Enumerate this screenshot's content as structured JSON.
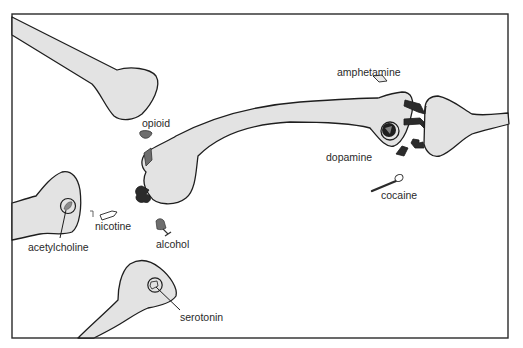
{
  "figure": {
    "type": "neuron-synapse-diagram",
    "frame_color": "#2a2a2a",
    "cell_fill": "#e3e3e3",
    "dark_fill": "#2b2b2b",
    "mid_fill": "#6e6e6e"
  },
  "labels": {
    "opioid": "opioid",
    "amphetamine": "amphetamine",
    "dopamine": "dopamine",
    "cocaine": "cocaine",
    "nicotine": "nicotine",
    "acetylcholine": "acetylcholine",
    "alcohol": "alcohol",
    "serotonin": "serotonin"
  },
  "elements": [
    {
      "id": "top-left-neuron",
      "description": "neuron terminal entering from top-left"
    },
    {
      "id": "central-neuron",
      "description": "long neuron from cell body (center-left) to axon terminal (right)"
    },
    {
      "id": "right-postsynaptic-neuron",
      "description": "postsynaptic dendrite with dopamine receptors"
    },
    {
      "id": "left-neuron",
      "description": "neuron terminal with acetylcholine vesicle"
    },
    {
      "id": "bottom-neuron",
      "description": "neuron terminal with serotonin vesicle"
    },
    {
      "id": "opioid-molecule",
      "label_key": "opioid"
    },
    {
      "id": "amphetamine-molecule",
      "label_key": "amphetamine"
    },
    {
      "id": "dopamine-vesicle",
      "label_key": "dopamine"
    },
    {
      "id": "cocaine-spoon",
      "label_key": "cocaine"
    },
    {
      "id": "nicotine-cigarette",
      "label_key": "nicotine"
    },
    {
      "id": "alcohol-glass",
      "label_key": "alcohol"
    },
    {
      "id": "acetylcholine-vesicle",
      "label_key": "acetylcholine"
    },
    {
      "id": "serotonin-vesicle",
      "label_key": "serotonin"
    }
  ]
}
